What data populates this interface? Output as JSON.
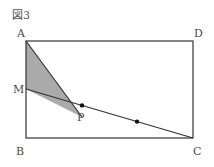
{
  "figure": {
    "title": "図3",
    "labels": {
      "A": "A",
      "B": "B",
      "C": "C",
      "D": "D",
      "M": "M",
      "P": "P"
    },
    "points": {
      "A": [
        26,
        41
      ],
      "B": [
        26,
        138
      ],
      "C": [
        193,
        138
      ],
      "D": [
        193,
        41
      ],
      "M": [
        26,
        89
      ],
      "P": [
        82,
        117
      ],
      "Q": [
        137,
        122
      ]
    },
    "shaded_region": "triangle AMP",
    "colors": {
      "line": "#333333",
      "shade": "#aaaaaa",
      "label": "#4a4a4a"
    }
  }
}
